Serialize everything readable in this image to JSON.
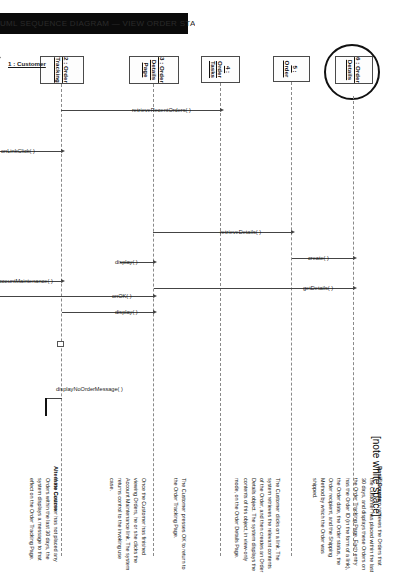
{
  "document": {
    "note_marker": "[note white space]",
    "redaction_bar_text": "UML SEQUENCE DIAGRAM — VIEW ORDER STATUS  (scanned page header)"
  },
  "diagram": {
    "type": "uml-sequence-diagram",
    "lifelines": [
      {
        "id": "customer",
        "label": "1 : Customer",
        "kind": "actor"
      },
      {
        "id": "order-tracking",
        "label": "2 : Order\nTracking",
        "kind": "object"
      },
      {
        "id": "order-details-page",
        "label": "3 : Order Details\nPage",
        "kind": "object"
      },
      {
        "id": "order-tasks",
        "label": "4 : Order\nTasks",
        "kind": "object"
      },
      {
        "id": "order",
        "label": "5 : Order",
        "kind": "object"
      },
      {
        "id": "order-details",
        "label": "6 : Order\nDetails",
        "kind": "boundary"
      }
    ],
    "messages": [
      {
        "seq": 1,
        "label": "retrieveRecentOrders( )",
        "from": "order-tracking",
        "to": "order-tasks"
      },
      {
        "seq": 2,
        "label": "retrieveDetails( )",
        "from": "order-details-page",
        "to": "order"
      },
      {
        "seq": 3,
        "label": "create( )",
        "from": "order",
        "to": "order-details"
      },
      {
        "seq": 4,
        "label": "getDetails( )",
        "from": "order-details-page",
        "to": "order-details"
      },
      {
        "seq": 5,
        "label": "display( )",
        "from": "order-details-page",
        "to": "order-details-page"
      },
      {
        "seq": 6,
        "label": "onOK( )",
        "from": "customer",
        "to": "order-details-page"
      },
      {
        "seq": 7,
        "label": "display( )",
        "from": "order-tracking",
        "to": "order-details-page"
      },
      {
        "seq": 8,
        "label": "onLinkClick( )",
        "from": "customer",
        "to": "order-tracking"
      },
      {
        "seq": 9,
        "label": "onAccountMaintenance( )",
        "from": "customer",
        "to": "order-tracking"
      },
      {
        "seq": 10,
        "label": "displayNoOrderMessage( )",
        "from": "order-tracking",
        "to": "order-tracking"
      }
    ]
  },
  "description": {
    "basic_course_heading": "Basic Course",
    "basic_course_paragraphs": [
      "The system retrieves the Orders that the Customer has placed within the last 30 days, and displays these Orders on the Order Tracking Page. Each entry has the Order ID (in the form of a link), the Order date, the Order status, the Order recipient, and the Shipping Method by which the Order was shipped.",
      "The Customer clicks on a link. The system retrieves the relevant contents of the Order, and then creates an Order Details object. The system displays the contents of this object, in view-only mode, on the Order Details Page.",
      "The Customer presses OK to return to the Order Tracking Page.",
      "Once the Customer has finished viewing Orders, he or she clicks the Account Maintenance link. The system returns control to the invoking use case."
    ],
    "alternate_course_heading": "Alternate Course",
    "alternate_course_paragraphs": [
      "If the Customer has not placed any Orders within the last 30 days, the system displays a message to that effect on the Order Tracking Page."
    ]
  }
}
